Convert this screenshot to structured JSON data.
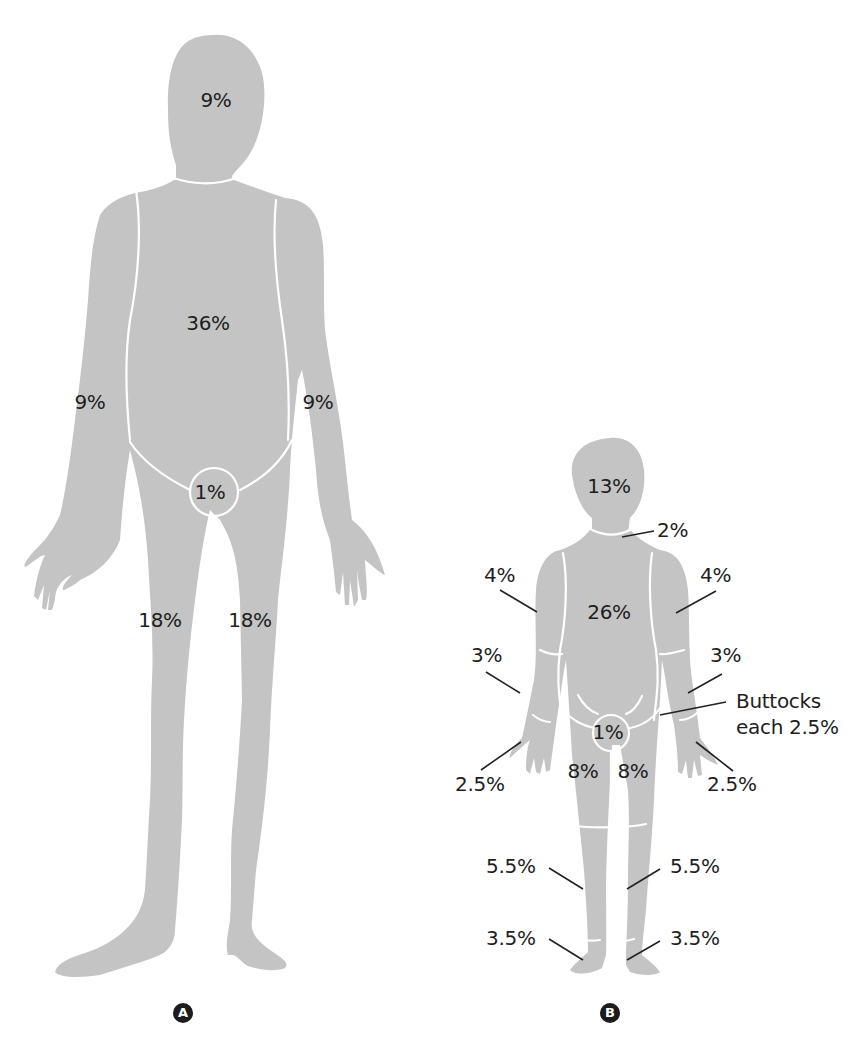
{
  "figure_a": {
    "badge": "A",
    "labels": {
      "head": "9%",
      "trunk": "36%",
      "right_arm": "9%",
      "left_arm": "9%",
      "genitalia": "1%",
      "right_leg": "18%",
      "left_leg": "18%"
    }
  },
  "figure_b": {
    "badge": "B",
    "labels": {
      "head": "13%",
      "neck": "2%",
      "right_upper_arm": "4%",
      "left_upper_arm": "4%",
      "trunk": "26%",
      "right_forearm": "3%",
      "left_forearm": "3%",
      "buttocks_line1": "Buttocks",
      "buttocks_line2": "each 2.5%",
      "genitalia": "1%",
      "right_hand": "2.5%",
      "left_hand": "2.5%",
      "right_thigh": "8%",
      "left_thigh": "8%",
      "right_lower_leg": "5.5%",
      "left_lower_leg": "5.5%",
      "right_foot": "3.5%",
      "left_foot": "3.5%"
    }
  },
  "colors": {
    "silhouette": "#c4c4c4",
    "seam": "#ffffff",
    "text": "#1e1e1e",
    "badge": "#1c1c1c"
  }
}
